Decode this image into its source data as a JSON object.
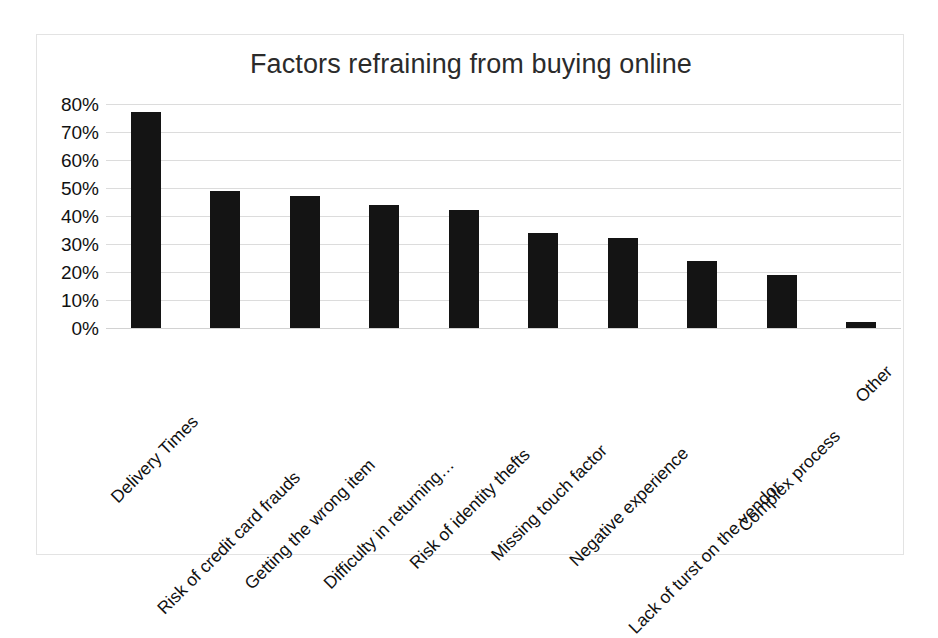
{
  "chart_data": {
    "type": "bar",
    "title": "Factors refraining from buying online",
    "xlabel": "",
    "ylabel": "",
    "ylim": [
      0,
      80
    ],
    "ytick_labels": [
      "80%",
      "70%",
      "60%",
      "50%",
      "40%",
      "30%",
      "20%",
      "10%",
      "0%"
    ],
    "ytick_values": [
      80,
      70,
      60,
      50,
      40,
      30,
      20,
      10,
      0
    ],
    "grid": true,
    "legend": false,
    "bar_color": "#141414",
    "gridline_color": "#dcdcdc",
    "categories": [
      "Delivery Times",
      "Risk of credit card frauds",
      "Getting the wrong item",
      "Difficulty in returning…",
      "Risk of identity thefts",
      "Missing touch factor",
      "Negative experience",
      "Lack of turst on the vendor",
      "Complex process",
      "Other"
    ],
    "values": [
      77,
      49,
      47,
      44,
      42,
      34,
      32,
      24,
      19,
      2
    ],
    "value_labels": [
      "77%",
      "49%",
      "47%",
      "44%",
      "42%",
      "34%",
      "32%",
      "24%",
      "19%",
      "2%"
    ]
  }
}
